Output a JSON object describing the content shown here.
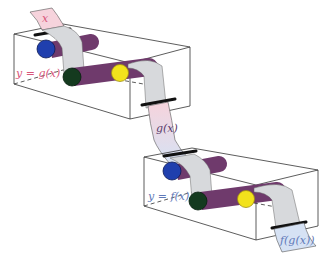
{
  "diagram": {
    "colors": {
      "input_paper": "#f6d3dc",
      "mid_paper_top": "#f6d3dc",
      "mid_paper_bottom": "#d6e2f4",
      "output_paper": "#d6e2f4",
      "belt": "#d7d9dc",
      "roller": "#6f3a6c",
      "roller_dark": "#5a2c58",
      "blue": "#1f3fae",
      "green": "#143a1f",
      "yellow": "#f2e21c",
      "label_pink": "#d8557a",
      "label_blue": "#5f79b8",
      "label_purple": "#5a3a6a"
    },
    "machines": [
      {
        "name": "g",
        "label": "y = g(x)",
        "input": "x",
        "output": "g(x)"
      },
      {
        "name": "f",
        "label": "y = f(x)",
        "input": "g(x)",
        "output": "f(g(x))"
      }
    ]
  }
}
